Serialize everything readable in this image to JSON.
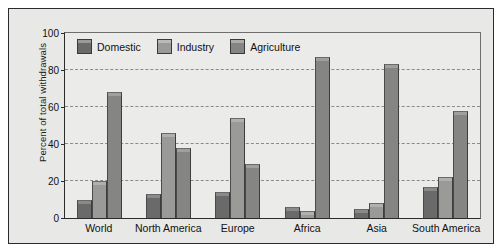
{
  "chart_data": {
    "type": "bar",
    "title": "",
    "xlabel": "",
    "ylabel": "Percent of total withdrawals",
    "ylim": [
      0,
      100
    ],
    "ytick_labels": [
      "100",
      "80",
      "60",
      "40",
      "20",
      "0"
    ],
    "ytick_values": [
      100,
      80,
      60,
      40,
      20,
      0
    ],
    "grid": true,
    "legend_position": "top-left inside plot",
    "categories": [
      "World",
      "North America",
      "Europe",
      "Africa",
      "Asia",
      "South America"
    ],
    "series": [
      {
        "name": "Domestic",
        "color": "#6a6a6a",
        "values": [
          10,
          13,
          14,
          6,
          5,
          17
        ]
      },
      {
        "name": "Industry",
        "color": "#9a9a98",
        "values": [
          20,
          46,
          54,
          4,
          8,
          22
        ]
      },
      {
        "name": "Agriculture",
        "color": "#858583",
        "values": [
          68,
          38,
          29,
          87,
          83,
          58
        ]
      }
    ]
  },
  "colors": {
    "figure_background": "#e8e8e6",
    "plot_background": "#ebebe9",
    "axis": "#2b2b2b",
    "gridline": "#8a8a88",
    "domestic": "#6a6a6a",
    "industry": "#9a9a98",
    "agriculture": "#858583"
  }
}
